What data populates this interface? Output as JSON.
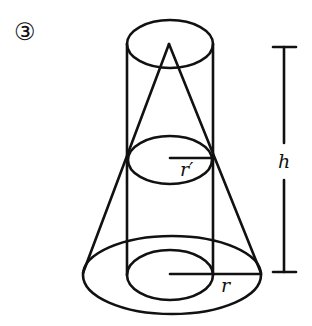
{
  "figure": {
    "number_label": "③",
    "labels": {
      "small_radius": "r′",
      "large_radius": "r",
      "height": "h"
    },
    "stroke_color": "#111111",
    "background": "#ffffff",
    "shapes": {
      "cylinder": {
        "cx": 170,
        "top_y": 44,
        "bottom_y": 275,
        "rx": 43,
        "ry": 24
      },
      "cone": {
        "apex": [
          169,
          44
        ],
        "base_cx": 172,
        "base_cy": 274,
        "rx": 90,
        "ry": 38
      },
      "section_ellipse": {
        "cx": 170,
        "cy": 158,
        "rx": 42,
        "ry": 24
      },
      "height_bar": {
        "x": 284,
        "y1": 47,
        "y2": 272
      }
    }
  }
}
